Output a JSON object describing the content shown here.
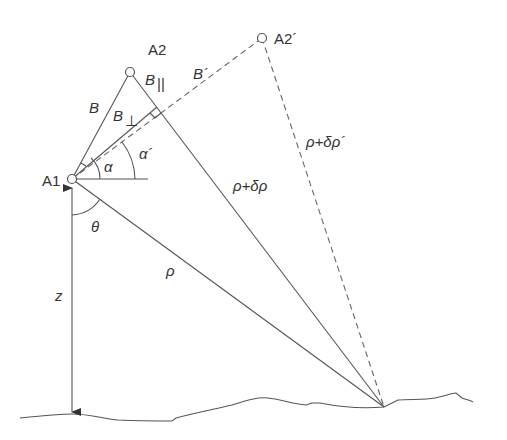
{
  "diagram": {
    "points": {
      "A1": "A1",
      "A2": "A2",
      "A2_prime": "A2´"
    },
    "baselines": {
      "B": "B",
      "B_parallel": "B",
      "B_parallel_sub": "||",
      "B_perp": "B",
      "B_perp_sub": "⊥",
      "B_prime": "B´"
    },
    "angles": {
      "alpha": "α",
      "alpha_prime": "α´",
      "theta": "θ"
    },
    "ranges": {
      "rho": "ρ",
      "rho_plus_delta": "ρ+δρ",
      "rho_plus_delta_prime": "ρ+δρ´"
    },
    "height": {
      "z": "z"
    },
    "colors": {
      "line": "#555555",
      "text": "#333333",
      "background": "#ffffff"
    }
  }
}
